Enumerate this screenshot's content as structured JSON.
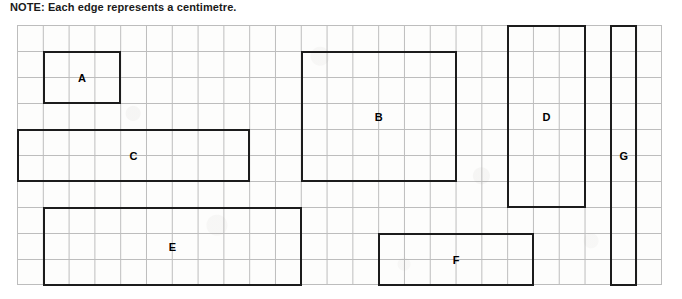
{
  "note": {
    "text": "NOTE: Each edge represents a centimetre."
  },
  "grid": {
    "columns": 25,
    "rows": 10,
    "cell_width_px": 25.8,
    "cell_height_px": 26,
    "line_color": "#bdbdbd",
    "paper_color": "#fdfdfc",
    "unit_label": "centimetre"
  },
  "shapes": [
    {
      "id": "A",
      "label": "A",
      "col": 1,
      "row": 1,
      "cols_wide": 3,
      "rows_tall": 2,
      "width_cm": 3,
      "height_cm": 2,
      "stroke": "#1c1c1c"
    },
    {
      "id": "B",
      "label": "B",
      "col": 11,
      "row": 1,
      "cols_wide": 6,
      "rows_tall": 5,
      "width_cm": 6,
      "height_cm": 5,
      "stroke": "#1c1c1c"
    },
    {
      "id": "C",
      "label": "C",
      "col": 0,
      "row": 4,
      "cols_wide": 9,
      "rows_tall": 2,
      "width_cm": 9,
      "height_cm": 2,
      "stroke": "#1c1c1c"
    },
    {
      "id": "D",
      "label": "D",
      "col": 19,
      "row": 0,
      "cols_wide": 3,
      "rows_tall": 7,
      "width_cm": 3,
      "height_cm": 7,
      "stroke": "#1c1c1c"
    },
    {
      "id": "E",
      "label": "E",
      "col": 1,
      "row": 7,
      "cols_wide": 10,
      "rows_tall": 3,
      "width_cm": 10,
      "height_cm": 3,
      "stroke": "#1c1c1c"
    },
    {
      "id": "F",
      "label": "F",
      "col": 14,
      "row": 8,
      "cols_wide": 6,
      "rows_tall": 2,
      "width_cm": 6,
      "height_cm": 2,
      "stroke": "#1c1c1c"
    },
    {
      "id": "G",
      "label": "G",
      "col": 23,
      "row": 0,
      "cols_wide": 1,
      "rows_tall": 10,
      "width_cm": 1,
      "height_cm": 10,
      "stroke": "#1c1c1c"
    }
  ]
}
